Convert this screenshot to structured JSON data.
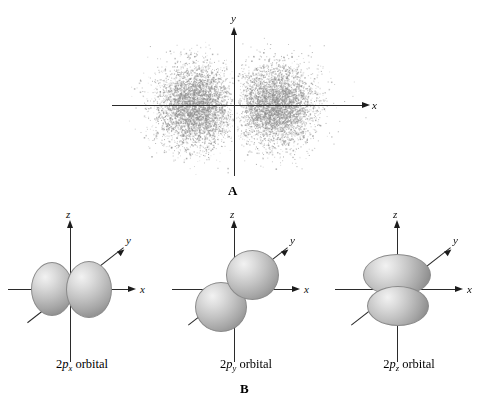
{
  "figure": {
    "background_color": "#ffffff",
    "axis_color": "#2b2b2b",
    "lobe_fill_light": "#f2f2f2",
    "lobe_fill_dark": "#7d7d7d",
    "dot_color": "#8c8c8c"
  },
  "panel_a": {
    "letter": "A",
    "x_axis_label": "x",
    "y_axis_label": "y",
    "description": "electron density dot distribution of a 2p orbital with two lobes along the x axis"
  },
  "panel_b": {
    "letter": "B",
    "orbitals": [
      {
        "prefix": "2",
        "symbol": "p",
        "subscript": "x",
        "suffix": " orbital",
        "caption": "2px orbital",
        "x_axis_label": "x",
        "y_axis_label": "y",
        "z_axis_label": "z",
        "lobe_axis": "x"
      },
      {
        "prefix": "2",
        "symbol": "p",
        "subscript": "y",
        "suffix": " orbital",
        "caption": "2py orbital",
        "x_axis_label": "x",
        "y_axis_label": "y",
        "z_axis_label": "z",
        "lobe_axis": "y"
      },
      {
        "prefix": "2",
        "symbol": "p",
        "subscript": "z",
        "suffix": " orbital",
        "caption": "2pz orbital",
        "x_axis_label": "x",
        "y_axis_label": "y",
        "z_axis_label": "z",
        "lobe_axis": "z"
      }
    ]
  }
}
